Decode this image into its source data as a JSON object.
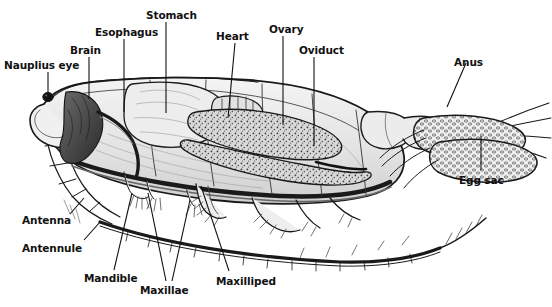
{
  "figure": {
    "type": "scientific-illustration",
    "background_color": "#ffffff",
    "ink_color": "#1a1a1a",
    "body_fill_color": "#e8e8e8",
    "organ_shade_color": "#555555"
  },
  "labels": [
    {
      "id": "nauplius-eye",
      "text": "Nauplius eye",
      "x": 4,
      "y": 60,
      "align": "left"
    },
    {
      "id": "brain",
      "text": "Brain",
      "x": 70,
      "y": 45,
      "align": "left"
    },
    {
      "id": "esophagus",
      "text": "Esophagus",
      "x": 95,
      "y": 27,
      "align": "left"
    },
    {
      "id": "stomach",
      "text": "Stomach",
      "x": 146,
      "y": 10,
      "align": "left"
    },
    {
      "id": "heart",
      "text": "Heart",
      "x": 216,
      "y": 31,
      "align": "left"
    },
    {
      "id": "ovary",
      "text": "Ovary",
      "x": 269,
      "y": 24,
      "align": "left"
    },
    {
      "id": "oviduct",
      "text": "Oviduct",
      "x": 299,
      "y": 45,
      "align": "left"
    },
    {
      "id": "anus",
      "text": "Anus",
      "x": 454,
      "y": 57,
      "align": "left"
    },
    {
      "id": "egg-sac",
      "text": "Egg sac",
      "x": 459,
      "y": 175,
      "align": "left"
    },
    {
      "id": "antenna",
      "text": "Antenna",
      "x": 22,
      "y": 215,
      "align": "left"
    },
    {
      "id": "antennule",
      "text": "Antennule",
      "x": 22,
      "y": 243,
      "align": "left"
    },
    {
      "id": "mandible",
      "text": "Mandible",
      "x": 84,
      "y": 273,
      "align": "left"
    },
    {
      "id": "maxillae",
      "text": "Maxillae",
      "x": 140,
      "y": 285,
      "align": "left"
    },
    {
      "id": "maxilliped",
      "text": "Maxilliped",
      "x": 216,
      "y": 276,
      "align": "left"
    }
  ],
  "leader_lines": [
    {
      "for": "nauplius-eye",
      "points": "48,72 48,97"
    },
    {
      "for": "brain",
      "points": "89,57 89,99"
    },
    {
      "for": "esophagus",
      "points": "124,39 124,112"
    },
    {
      "for": "stomach",
      "points": "166,22 166,113"
    },
    {
      "for": "heart",
      "points": "235,43 228,118"
    },
    {
      "for": "ovary",
      "points": "283,36 283,125"
    },
    {
      "for": "oviduct",
      "points": "314,57 314,146"
    },
    {
      "for": "anus",
      "points": "466,63 447,107"
    },
    {
      "for": "egg-sac",
      "points": "481,170 481,136"
    },
    {
      "for": "antenna",
      "points": "70,214 84,198"
    },
    {
      "for": "antennule",
      "points": "84,240 100,222"
    },
    {
      "for": "mandible",
      "points": "114,270 132,193"
    },
    {
      "for": "maxillae",
      "points": "166,281 148,193"
    },
    {
      "for": "maxillae-2",
      "points": "172,281 190,200"
    },
    {
      "for": "maxilliped",
      "points": "229,271 201,186"
    }
  ]
}
